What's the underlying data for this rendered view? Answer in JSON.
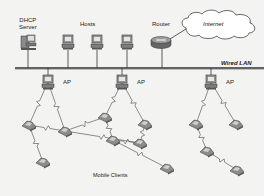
{
  "diagram": {
    "labels": {
      "dhcp_line1": "DHCP",
      "dhcp_line2": "Server",
      "hosts": "Hosts",
      "router": "Router",
      "internet": "Internet",
      "wired_lan": "Wired LAN",
      "ap": "AP",
      "mobile_clients": "Mobile Clients"
    },
    "colors": {
      "background": "#f3f3f1",
      "line": "#333333",
      "device": "#8a8a8a",
      "device_dark": "#555555",
      "router": "#7a7a7a",
      "cloud_fill": "#ffffff",
      "text": "#222222"
    },
    "wired_nodes": [
      {
        "id": "dhcp-server",
        "type": "server",
        "x": 28,
        "y": 42
      },
      {
        "id": "host-1",
        "type": "host",
        "x": 68,
        "y": 42
      },
      {
        "id": "host-2",
        "type": "host",
        "x": 97,
        "y": 42
      },
      {
        "id": "host-3",
        "type": "host",
        "x": 127,
        "y": 42
      },
      {
        "id": "router",
        "type": "router",
        "x": 161,
        "y": 42
      }
    ],
    "access_points": [
      {
        "id": "ap-1",
        "x": 48,
        "y": 82
      },
      {
        "id": "ap-2",
        "x": 122,
        "y": 82
      },
      {
        "id": "ap-3",
        "x": 211,
        "y": 82
      }
    ],
    "mobile_clients": [
      {
        "id": "mc-1",
        "x": 29,
        "y": 125
      },
      {
        "id": "mc-2",
        "x": 65,
        "y": 131
      },
      {
        "id": "mc-3",
        "x": 105,
        "y": 117
      },
      {
        "id": "mc-4",
        "x": 113,
        "y": 140
      },
      {
        "id": "mc-5",
        "x": 145,
        "y": 124
      },
      {
        "id": "mc-6",
        "x": 140,
        "y": 143
      },
      {
        "id": "mc-7",
        "x": 43,
        "y": 162
      },
      {
        "id": "mc-8",
        "x": 167,
        "y": 168
      },
      {
        "id": "mc-9",
        "x": 196,
        "y": 124
      },
      {
        "id": "mc-10",
        "x": 236,
        "y": 124
      },
      {
        "id": "mc-11",
        "x": 207,
        "y": 151
      },
      {
        "id": "mc-12",
        "x": 237,
        "y": 170
      }
    ],
    "wireless_links": [
      [
        "ap-1",
        "mc-1"
      ],
      [
        "ap-1",
        "mc-2"
      ],
      [
        "mc-1",
        "mc-2"
      ],
      [
        "mc-1",
        "mc-7"
      ],
      [
        "mc-2",
        "mc-3"
      ],
      [
        "mc-2",
        "mc-6"
      ],
      [
        "ap-2",
        "mc-3"
      ],
      [
        "ap-2",
        "mc-5"
      ],
      [
        "mc-3",
        "mc-4"
      ],
      [
        "mc-6",
        "mc-4"
      ],
      [
        "mc-4",
        "mc-8"
      ],
      [
        "mc-6",
        "mc-5"
      ],
      [
        "ap-3",
        "mc-9"
      ],
      [
        "ap-3",
        "mc-10"
      ],
      [
        "mc-9",
        "mc-11"
      ],
      [
        "mc-11",
        "mc-12"
      ]
    ]
  }
}
